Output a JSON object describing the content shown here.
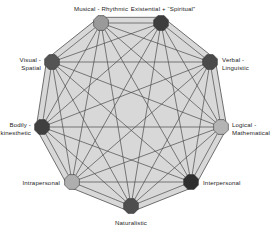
{
  "diagram": {
    "shape": "nonagon",
    "background_color": "#ffffff",
    "polygon_fill_color": "#d8d8d8",
    "polygon_stroke_color": "#6e6e6e",
    "edge_color": "#4a4a4a",
    "node_count": 9,
    "edge_style": "complete-graph",
    "nodes": [
      {
        "id": "musical-rhythmic",
        "label": "Musical - Rhythmic",
        "label_lines": [
          "Musical - Rhythmic"
        ],
        "color": "#9a9a9a",
        "cx": 101,
        "cy": 23,
        "r": 8.0,
        "label_x": 101,
        "label_y": 5,
        "label_align": "center"
      },
      {
        "id": "existential-spiritual",
        "label": "Existential + \"Spiritual\"",
        "label_lines": [
          "Existential + “Spiritual”"
        ],
        "color": "#3d3d3d",
        "cx": 161,
        "cy": 23,
        "r": 8.0,
        "label_x": 163,
        "label_y": 5,
        "label_align": "center"
      },
      {
        "id": "verbal-linguistic",
        "label": "Verbal - Linguistic",
        "label_lines": [
          "Verbal -",
          "Linguistic"
        ],
        "color": "#4a4a4a",
        "cx": 210,
        "cy": 62,
        "r": 8.0,
        "label_x": 222,
        "label_y": 56,
        "label_align": "left"
      },
      {
        "id": "logical-mathematical",
        "label": "Logical - Mathematical",
        "label_lines": [
          "Logical -",
          "Mathematical"
        ],
        "color": "#b4b4b4",
        "cx": 221,
        "cy": 127,
        "r": 8.0,
        "label_x": 232,
        "label_y": 121,
        "label_align": "left"
      },
      {
        "id": "interpersonal",
        "label": "Interpersonal",
        "label_lines": [
          "Interpersonal"
        ],
        "color": "#2f2f2f",
        "cx": 191,
        "cy": 182,
        "r": 8.0,
        "label_x": 203,
        "label_y": 179,
        "label_align": "left"
      },
      {
        "id": "naturalistic",
        "label": "Naturalistic",
        "label_lines": [
          "Naturalistic"
        ],
        "color": "#4e4e4e",
        "cx": 131,
        "cy": 206,
        "r": 8.0,
        "label_x": 131,
        "label_y": 219,
        "label_align": "center"
      },
      {
        "id": "intrapersonal",
        "label": "Intrapersonal",
        "label_lines": [
          "Intrapersonal"
        ],
        "color": "#aeaeae",
        "cx": 72,
        "cy": 182,
        "r": 8.0,
        "label_x": 60,
        "label_y": 179,
        "label_align": "right"
      },
      {
        "id": "bodily-kinesthetic",
        "label": "Bodily - kinesthetic",
        "label_lines": [
          "Bodily -",
          "kinesthetic"
        ],
        "color": "#404040",
        "cx": 42,
        "cy": 127,
        "r": 8.0,
        "label_x": 31,
        "label_y": 121,
        "label_align": "right"
      },
      {
        "id": "visual-spatial",
        "label": "Visual - Spatial",
        "label_lines": [
          "Visual -",
          "Spatial"
        ],
        "color": "#545454",
        "cx": 52,
        "cy": 62,
        "r": 8.0,
        "label_x": 41,
        "label_y": 56,
        "label_align": "right"
      }
    ]
  }
}
